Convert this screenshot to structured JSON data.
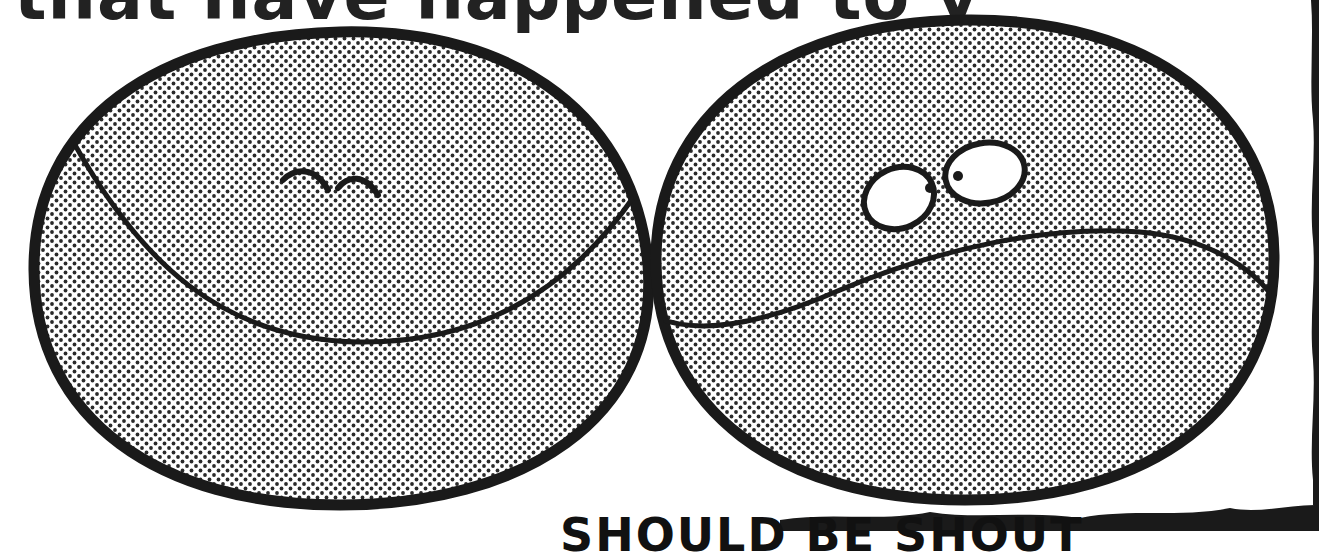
{
  "caption": {
    "text": "that have happened to y"
  },
  "bottom_caption": {
    "text": "SHOULD BE SHOUT"
  },
  "colors": {
    "ink": "#1a1a1a",
    "paper": "#ffffff",
    "dot": "#2a2a2a"
  },
  "figures": [
    {
      "name": "happy-ball",
      "expression": "closed smiling eyes with a wide smile"
    },
    {
      "name": "worried-ball",
      "expression": "wide open eyes with a wavy frown"
    }
  ]
}
